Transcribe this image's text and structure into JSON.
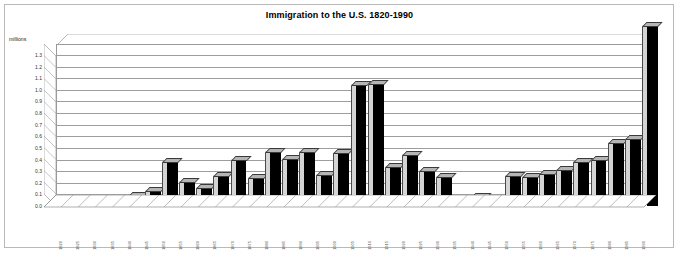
{
  "chart_data": {
    "type": "bar",
    "title": "Immigration to the U.S. 1820-1990",
    "xlabel": "",
    "ylabel": "millions",
    "ylim": [
      0.0,
      1.3
    ],
    "grid": true,
    "legend": "none",
    "ytick_labels": [
      "1.3",
      "1.2",
      "1.1",
      "1.0",
      "0.9",
      "0.8",
      "0.7",
      "0.6",
      "0.5",
      "0.4",
      "0.3",
      "0.2",
      "0.1",
      "0.0"
    ],
    "ytick_values": [
      1.3,
      1.2,
      1.1,
      1.0,
      0.9,
      0.8,
      0.7,
      0.6,
      0.5,
      0.4,
      0.3,
      0.2,
      0.1,
      0.0
    ],
    "categories": [
      "1820",
      "1825",
      "1830",
      "1835",
      "1840",
      "1845",
      "1850",
      "1855",
      "1860",
      "1865",
      "1870",
      "1875",
      "1880",
      "1885",
      "1890",
      "1895",
      "1900",
      "1905",
      "1910",
      "1915",
      "1920",
      "1925",
      "1930",
      "1935",
      "1940",
      "1945",
      "1950",
      "1955",
      "1960",
      "1965",
      "1970",
      "1975",
      "1980",
      "1985",
      "1990"
    ],
    "values": [
      0.01,
      0.01,
      0.02,
      0.05,
      0.08,
      0.12,
      0.37,
      0.2,
      0.15,
      0.25,
      0.39,
      0.23,
      0.46,
      0.4,
      0.46,
      0.26,
      0.45,
      1.03,
      1.04,
      0.33,
      0.43,
      0.29,
      0.24,
      0.04,
      0.07,
      0.04,
      0.25,
      0.24,
      0.27,
      0.3,
      0.37,
      0.39,
      0.53,
      0.57,
      1.54
    ],
    "series_color": "#000000",
    "side_color": "#d4d4d4",
    "top_color": "#b5b5b5",
    "grid_color": "#9d9d9d",
    "border_color": "#b9b9b9",
    "background": "#ffffff"
  }
}
